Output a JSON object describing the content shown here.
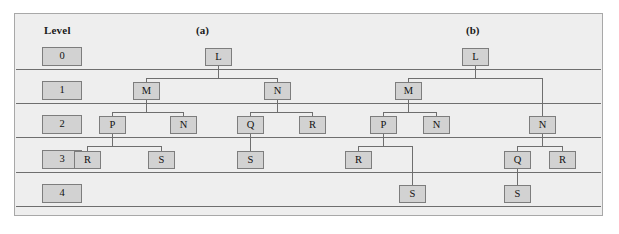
{
  "figure": {
    "background_color": "#eeeeee",
    "border_color": "#a8a8a8",
    "node_fill_color": "#d2d2d2",
    "node_border_color": "#7d7d7d",
    "line_color": "#6e6e6e"
  },
  "level_column": {
    "header": "Level",
    "levels": [
      "0",
      "1",
      "2",
      "3",
      "4"
    ]
  },
  "panels": [
    {
      "label": "(a)",
      "nodes": [
        {
          "id": "a-L",
          "label": "L",
          "level": 0
        },
        {
          "id": "a-M",
          "label": "M",
          "level": 1
        },
        {
          "id": "a-N1",
          "label": "N",
          "level": 1
        },
        {
          "id": "a-P",
          "label": "P",
          "level": 2
        },
        {
          "id": "a-N2",
          "label": "N",
          "level": 2
        },
        {
          "id": "a-Q",
          "label": "Q",
          "level": 2
        },
        {
          "id": "a-R1",
          "label": "R",
          "level": 2
        },
        {
          "id": "a-R2",
          "label": "R",
          "level": 3
        },
        {
          "id": "a-S1",
          "label": "S",
          "level": 3
        },
        {
          "id": "a-S2",
          "label": "S",
          "level": 3
        }
      ],
      "edges": [
        [
          "a-L",
          "a-M"
        ],
        [
          "a-L",
          "a-N1"
        ],
        [
          "a-M",
          "a-P"
        ],
        [
          "a-M",
          "a-N2"
        ],
        [
          "a-N1",
          "a-Q"
        ],
        [
          "a-N1",
          "a-R1"
        ],
        [
          "a-P",
          "a-R2"
        ],
        [
          "a-P",
          "a-S1"
        ],
        [
          "a-Q",
          "a-S2"
        ]
      ]
    },
    {
      "label": "(b)",
      "nodes": [
        {
          "id": "b-L",
          "label": "L",
          "level": 0
        },
        {
          "id": "b-M",
          "label": "M",
          "level": 1
        },
        {
          "id": "b-P",
          "label": "P",
          "level": 2
        },
        {
          "id": "b-N1",
          "label": "N",
          "level": 2
        },
        {
          "id": "b-N2",
          "label": "N",
          "level": 2
        },
        {
          "id": "b-R1",
          "label": "R",
          "level": 3
        },
        {
          "id": "b-Q",
          "label": "Q",
          "level": 3
        },
        {
          "id": "b-R2",
          "label": "R",
          "level": 3
        },
        {
          "id": "b-S1",
          "label": "S",
          "level": 4
        },
        {
          "id": "b-S2",
          "label": "S",
          "level": 4
        }
      ],
      "edges": [
        [
          "b-L",
          "b-M"
        ],
        [
          "b-L",
          "b-N2"
        ],
        [
          "b-M",
          "b-P"
        ],
        [
          "b-M",
          "b-N1"
        ],
        [
          "b-P",
          "b-R1"
        ],
        [
          "b-P",
          "b-S1"
        ],
        [
          "b-N2",
          "b-Q"
        ],
        [
          "b-N2",
          "b-R2"
        ],
        [
          "b-Q",
          "b-S2"
        ]
      ]
    }
  ]
}
